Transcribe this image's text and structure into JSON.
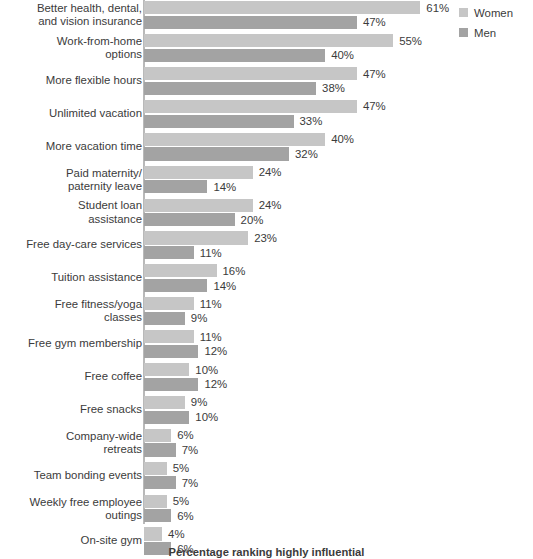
{
  "chart_data": {
    "type": "bar",
    "orientation": "horizontal",
    "title": "",
    "caption": "Percentage ranking highly influential",
    "xlabel": "",
    "ylabel": "",
    "xlim": [
      0,
      61
    ],
    "grid": false,
    "legend_position": "top-right",
    "value_suffix": "%",
    "categories": [
      "Better health, dental,\nand vision insurance",
      "Work-from-home\noptions",
      "More flexible hours",
      "Unlimited vacation",
      "More vacation time",
      "Paid maternity/\npaternity leave",
      "Student loan\nassistance",
      "Free day-care services",
      "Tuition assistance",
      "Free fitness/yoga\nclasses",
      "Free gym membership",
      "Free coffee",
      "Free snacks",
      "Company-wide\nretreats",
      "Team bonding events",
      "Weekly free employee\noutings",
      "On-site gym"
    ],
    "series": [
      {
        "name": "Women",
        "color": "#c6c6c6",
        "values": [
          61,
          55,
          47,
          47,
          40,
          24,
          24,
          23,
          16,
          11,
          11,
          10,
          9,
          6,
          5,
          5,
          4
        ],
        "labels": [
          "61%",
          "55%",
          "47%",
          "47%",
          "40%",
          "24%",
          "24%",
          "23%",
          "16%",
          "11%",
          "11%",
          "10%",
          "9%",
          "6%",
          "5%",
          "5%",
          "4%"
        ]
      },
      {
        "name": "Men",
        "color": "#a3a3a3",
        "values": [
          47,
          40,
          38,
          33,
          32,
          14,
          20,
          11,
          14,
          9,
          12,
          12,
          10,
          7,
          7,
          6,
          6
        ],
        "labels": [
          "47%",
          "40%",
          "38%",
          "33%",
          "32%",
          "14%",
          "20%",
          "11%",
          "14%",
          "9%",
          "12%",
          "12%",
          "10%",
          "7%",
          "7%",
          "6%",
          "6%"
        ]
      }
    ]
  },
  "legend": {
    "items": [
      {
        "label": "Women",
        "color": "#c6c6c6"
      },
      {
        "label": "Men",
        "color": "#a3a3a3"
      }
    ]
  },
  "colors": {
    "women": "#c6c6c6",
    "men": "#a3a3a3",
    "axis": "#b9b9b9",
    "text": "#3b3b3b",
    "background": "#ffffff"
  }
}
